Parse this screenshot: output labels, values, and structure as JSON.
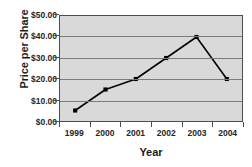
{
  "chart_data": {
    "type": "line",
    "title": "",
    "xlabel": "Year",
    "ylabel": "Price per Share",
    "categories": [
      "1999",
      "2000",
      "2001",
      "2002",
      "2003",
      "2004"
    ],
    "values": [
      5.0,
      15.0,
      20.0,
      30.0,
      40.0,
      20.0
    ],
    "series": [
      {
        "name": "Price per Share",
        "values": [
          5.0,
          15.0,
          20.0,
          30.0,
          40.0,
          20.0
        ]
      }
    ],
    "ylim": [
      0,
      50
    ],
    "ytick_values": [
      0,
      10,
      20,
      30,
      40,
      50
    ],
    "ytick_labels": [
      "$0.00",
      "$10.00",
      "$20.00",
      "$30.00",
      "$40.00",
      "$50.00"
    ],
    "grid": true,
    "legend": "none",
    "line_color": "#000000",
    "marker_color": "#000000",
    "plot_background": "#d9d9d9",
    "gridline_color": "#7a7a7a",
    "axis_color": "#4d4d4d"
  }
}
